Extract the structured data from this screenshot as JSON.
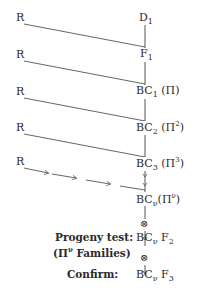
{
  "diagram": {
    "colors": {
      "ink": "#2a2a2a",
      "line": "#555555",
      "background": "#ffffff"
    },
    "recurrent_parent_label": "R",
    "stages": [
      {
        "id": "d1",
        "base": "D",
        "sub": "1",
        "extra_pre": "",
        "extra_sup": "",
        "extra_post": ""
      },
      {
        "id": "f1",
        "base": "F",
        "sub": "1",
        "extra_pre": "",
        "extra_sup": "",
        "extra_post": ""
      },
      {
        "id": "bc1",
        "base": "BC",
        "sub": "1",
        "extra_pre": "(Π",
        "extra_sup": "",
        "extra_post": ")"
      },
      {
        "id": "bc2",
        "base": "BC",
        "sub": "2",
        "extra_pre": "(Π",
        "extra_sup": "2",
        "extra_post": ")"
      },
      {
        "id": "bc3",
        "base": "BC",
        "sub": "3",
        "extra_pre": "(Π",
        "extra_sup": "3",
        "extra_post": ")"
      },
      {
        "id": "bcv",
        "base": "BC",
        "sub": "ν",
        "extra_pre": "(Π",
        "extra_sup": "ν",
        "extra_post": ")"
      },
      {
        "id": "bcvf2",
        "base": "BC",
        "sub": "ν",
        "extra_pre": " F",
        "extra_sup": "",
        "extra_post": "",
        "extra_sub": "2"
      },
      {
        "id": "bcvf3",
        "base": "BC",
        "sub": "ν",
        "extra_pre": " F",
        "extra_sup": "",
        "extra_post": "",
        "extra_sub": "3"
      }
    ],
    "self_symbol": "⊗",
    "side_labels": {
      "progeny_test_line1": "Progeny test:",
      "progeny_test_line2_pre": "(Π",
      "progeny_test_line2_sup": "ν",
      "progeny_test_line2_post": " Families)",
      "confirm": "Confirm:"
    }
  }
}
